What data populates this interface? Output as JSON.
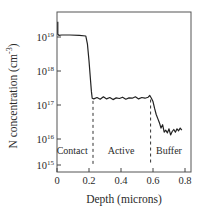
{
  "chart_data": {
    "type": "line",
    "title": "",
    "xlabel": "Depth (microns)",
    "ylabel": "N concentration (cm^-3)",
    "ylabel_parts": {
      "main": "N concentration (cm",
      "sup": "-3",
      "close": ")"
    },
    "xlim": [
      0,
      0.8
    ],
    "ylim_log10": [
      15,
      19.6
    ],
    "yscale": "log",
    "grid": false,
    "legend": null,
    "x_ticks": [
      {
        "value": 0,
        "label": "0"
      },
      {
        "value": 0.2,
        "label": "0.2"
      },
      {
        "value": 0.4,
        "label": "0.4"
      },
      {
        "value": 0.6,
        "label": "0.6"
      },
      {
        "value": 0.8,
        "label": "0.8"
      }
    ],
    "y_ticks": [
      {
        "exp": 15,
        "base": "10",
        "sup": "15"
      },
      {
        "exp": 16,
        "base": "10",
        "sup": "16"
      },
      {
        "exp": 17,
        "base": "10",
        "sup": "17"
      },
      {
        "exp": 18,
        "base": "10",
        "sup": "18"
      },
      {
        "exp": 19,
        "base": "10",
        "sup": "19"
      }
    ],
    "series": [
      {
        "name": "N concentration profile",
        "color": "#222222",
        "x": [
          0.005,
          0.005,
          0.012,
          0.03,
          0.08,
          0.14,
          0.18,
          0.19,
          0.2,
          0.21,
          0.215,
          0.22,
          0.23,
          0.25,
          0.27,
          0.29,
          0.31,
          0.33,
          0.35,
          0.37,
          0.39,
          0.41,
          0.43,
          0.45,
          0.47,
          0.49,
          0.51,
          0.53,
          0.55,
          0.57,
          0.58,
          0.59,
          0.6,
          0.61,
          0.62,
          0.63,
          0.64,
          0.65,
          0.66,
          0.67,
          0.68,
          0.69,
          0.7,
          0.71,
          0.72,
          0.73,
          0.74,
          0.75,
          0.76,
          0.77,
          0.78
        ],
        "log10_y": [
          19.45,
          19.08,
          19.05,
          19.06,
          19.06,
          19.05,
          19.03,
          18.8,
          18.3,
          17.7,
          17.4,
          17.2,
          17.18,
          17.22,
          17.17,
          17.24,
          17.18,
          17.22,
          17.16,
          17.21,
          17.19,
          17.23,
          17.17,
          17.21,
          17.2,
          17.24,
          17.18,
          17.22,
          17.2,
          17.23,
          17.28,
          17.2,
          17.1,
          16.9,
          16.72,
          16.6,
          16.48,
          16.32,
          16.42,
          16.2,
          16.26,
          16.18,
          16.3,
          16.12,
          16.22,
          16.28,
          16.2,
          16.3,
          16.24,
          16.32,
          16.26
        ]
      }
    ],
    "annotations": [
      {
        "type": "vline",
        "x": 0.225,
        "style": "dashed",
        "from_log10": 15.0,
        "to_log10": 17.18
      },
      {
        "type": "vline",
        "x": 0.585,
        "style": "dashed",
        "from_log10": 15.0,
        "to_log10": 17.22
      },
      {
        "type": "text",
        "text": "Contact",
        "x": 0.095,
        "log10_y": 15.6
      },
      {
        "type": "text",
        "text": "Active",
        "x": 0.4,
        "log10_y": 15.6
      },
      {
        "type": "text",
        "text": "Buffer",
        "x": 0.7,
        "log10_y": 15.6
      }
    ],
    "region_labels": [
      "Contact",
      "Active",
      "Buffer"
    ]
  },
  "frame": {
    "left": 57,
    "right": 191,
    "top": 12,
    "bottom": 172
  },
  "colors": {
    "line": "#222222",
    "axis": "#444444",
    "text": "#2a2a2a",
    "background": "#ffffff"
  }
}
